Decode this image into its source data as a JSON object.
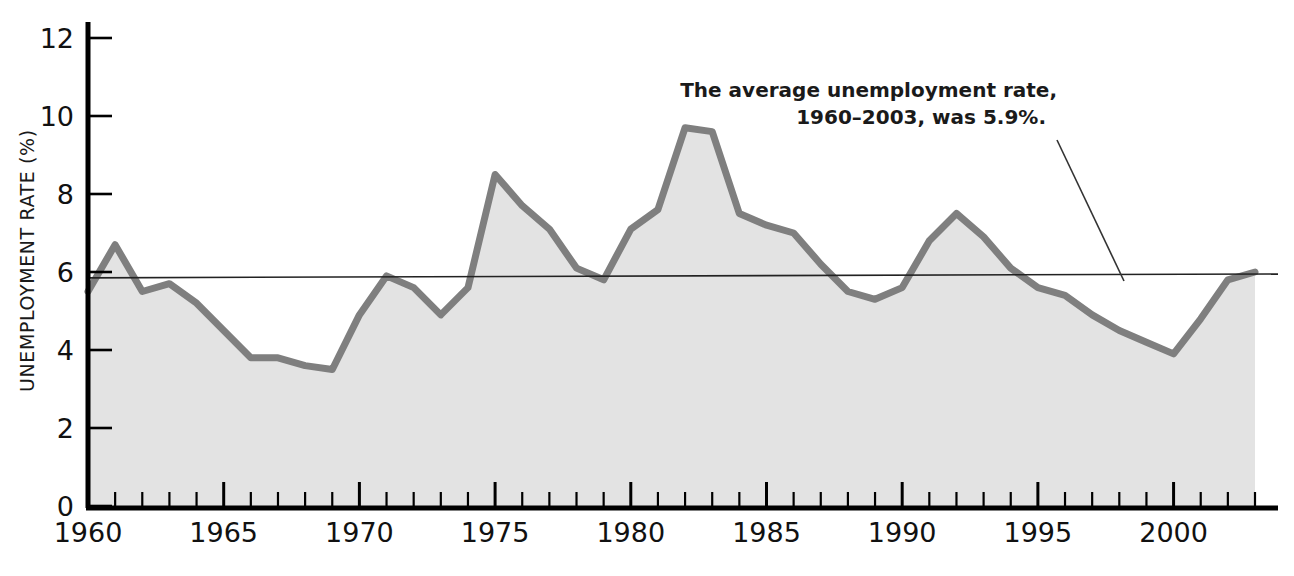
{
  "chart_data": {
    "type": "area",
    "title": "",
    "subtitle": "",
    "xlabel": "",
    "ylabel": "UNEMPLOYMENT RATE (%)",
    "xlim": [
      1960,
      2003
    ],
    "ylim": [
      0,
      12.6
    ],
    "ytick_values": [
      0,
      2,
      4,
      6,
      8,
      10,
      12
    ],
    "ytick_labels": [
      "0",
      "2",
      "4",
      "6",
      "8",
      "10",
      "12"
    ],
    "xtick_values": [
      1960,
      1965,
      1970,
      1975,
      1980,
      1985,
      1990,
      1995,
      2000
    ],
    "xtick_labels": [
      "1960",
      "1965",
      "1970",
      "1975",
      "1980",
      "1985",
      "1990",
      "1995",
      "2000"
    ],
    "x_minor_tick_step": 1,
    "grid": false,
    "legend": "none",
    "x": [
      1960,
      1961,
      1962,
      1963,
      1964,
      1965,
      1966,
      1967,
      1968,
      1969,
      1970,
      1971,
      1972,
      1973,
      1974,
      1975,
      1976,
      1977,
      1978,
      1979,
      1980,
      1981,
      1982,
      1983,
      1984,
      1985,
      1986,
      1987,
      1988,
      1989,
      1990,
      1991,
      1992,
      1993,
      1994,
      1995,
      1996,
      1997,
      1998,
      1999,
      2000,
      2001,
      2002,
      2003
    ],
    "values": [
      5.5,
      6.7,
      5.5,
      5.7,
      5.2,
      4.5,
      3.8,
      3.8,
      3.6,
      3.5,
      4.9,
      5.9,
      5.6,
      4.9,
      5.6,
      8.5,
      7.7,
      7.1,
      6.1,
      5.8,
      7.1,
      7.6,
      9.7,
      9.6,
      7.5,
      7.2,
      7.0,
      6.2,
      5.5,
      5.3,
      5.6,
      6.8,
      7.5,
      6.9,
      6.1,
      5.6,
      5.4,
      4.9,
      4.5,
      4.2,
      3.9,
      4.8,
      5.8,
      6.0
    ],
    "series_name": "Unemployment rate",
    "reference_line": {
      "label": "average",
      "value_start": 5.85,
      "value_end": 5.95
    },
    "annotation": {
      "line1": "The average unemployment rate,",
      "line2": "1960–2003, was 5.9%."
    },
    "colors": {
      "line": "#7f7f7f",
      "fill": "#e3e3e3",
      "axis": "#000000",
      "text": "#111111",
      "annotation_leader": "#333333"
    }
  }
}
